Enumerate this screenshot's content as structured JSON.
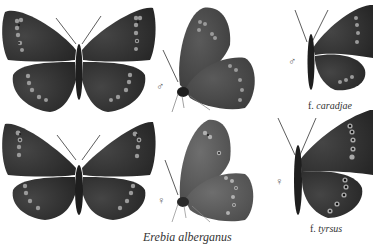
{
  "plate": {
    "caption": "Erebia alberganus",
    "colors": {
      "background": "#ffffff",
      "wing_dark": "#2b2b2b",
      "wing_mid": "#3d3d3d",
      "wing_underside_female": "#5a5a5a",
      "spot_ring": "#9a9a9a",
      "spot_center": "#111111",
      "text": "#333333"
    },
    "specimens": [
      {
        "id": "male-upperside",
        "sex": "male",
        "view": "upperside"
      },
      {
        "id": "male-underside",
        "sex": "male",
        "view": "underside",
        "sex_symbol": "♂"
      },
      {
        "id": "male-caradjae",
        "sex": "male",
        "view": "upperside-half",
        "sex_symbol": "♂",
        "form_prefix": "f.",
        "form_name": "caradjae"
      },
      {
        "id": "female-upperside",
        "sex": "female",
        "view": "upperside"
      },
      {
        "id": "female-underside",
        "sex": "female",
        "view": "underside",
        "sex_symbol": "♀"
      },
      {
        "id": "female-tyrsus",
        "sex": "female",
        "view": "upperside-half",
        "sex_symbol": "♀",
        "form_prefix": "f.",
        "form_name": "tyrsus"
      }
    ]
  }
}
